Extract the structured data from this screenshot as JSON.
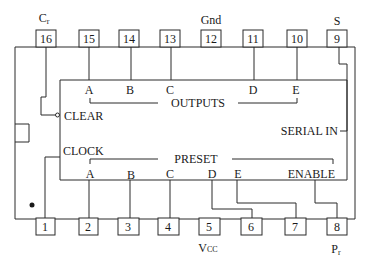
{
  "colors": {
    "line": "#2a2a2a",
    "text": "#1a1a1a",
    "background": "#ffffff"
  },
  "pins_top": [
    {
      "num": "16",
      "label": "C",
      "label_sub": "r"
    },
    {
      "num": "15",
      "label": ""
    },
    {
      "num": "14",
      "label": ""
    },
    {
      "num": "13",
      "label": ""
    },
    {
      "num": "12",
      "label": "Gnd"
    },
    {
      "num": "11",
      "label": ""
    },
    {
      "num": "10",
      "label": ""
    },
    {
      "num": "9",
      "label": "S"
    }
  ],
  "pins_bottom": [
    {
      "num": "1",
      "label": ""
    },
    {
      "num": "2",
      "label": ""
    },
    {
      "num": "3",
      "label": ""
    },
    {
      "num": "4",
      "label": ""
    },
    {
      "num": "5",
      "label": "V",
      "label_sub": "CC"
    },
    {
      "num": "6",
      "label": ""
    },
    {
      "num": "7",
      "label": ""
    },
    {
      "num": "8",
      "label": "P",
      "label_sub": "r"
    }
  ],
  "outputs": {
    "group_label": "OUTPUTS",
    "letters": [
      "A",
      "B",
      "C",
      "D",
      "E"
    ]
  },
  "preset": {
    "group_label": "PRESET",
    "letters": [
      "A",
      "B",
      "C",
      "D",
      "E"
    ]
  },
  "signals": {
    "clear": "CLEAR",
    "clock": "CLOCK",
    "serial_in": "SERIAL IN",
    "enable": "ENABLE"
  }
}
